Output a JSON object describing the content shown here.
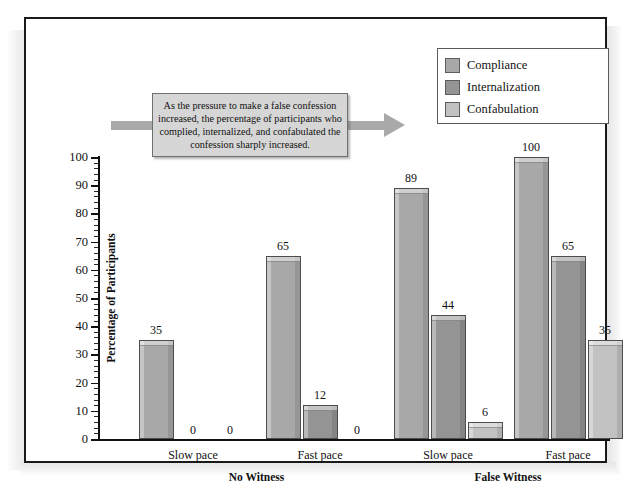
{
  "figure": {
    "frame_color": "#1a1a1a",
    "background": "#ffffff"
  },
  "callout": {
    "text": "As the pressure to make a false confession increased, the percentage of participants who complied, internalized, and confabulated the confession sharply increased.",
    "box_color": "#d6d6d6",
    "arrow_color": "#a9a9a9"
  },
  "legend": {
    "items": [
      {
        "label": "Compliance",
        "color": "#a8a8a8"
      },
      {
        "label": "Internalization",
        "color": "#949494"
      },
      {
        "label": "Confabulation",
        "color": "#c2c2c2"
      }
    ]
  },
  "chart_data": {
    "type": "bar",
    "title": "",
    "xlabel": "",
    "ylabel": "Percentage of Participants",
    "ylim": [
      0,
      100
    ],
    "ytick_step": 10,
    "yticks": [
      0,
      10,
      20,
      30,
      40,
      50,
      60,
      70,
      80,
      90,
      100
    ],
    "ytick_labels": [
      "0",
      "10",
      "20",
      "30",
      "40",
      "50",
      "60",
      "70",
      "80",
      "90",
      "100"
    ],
    "grid": false,
    "legend_position": "top-right",
    "categories": [
      "Slow pace",
      "Fast pace",
      "Slow pace",
      "Fast pace"
    ],
    "group_labels": [
      "No Witness",
      "False Witness"
    ],
    "groups": [
      {
        "group": "No Witness",
        "pace": "Slow pace"
      },
      {
        "group": "No Witness",
        "pace": "Fast pace"
      },
      {
        "group": "False Witness",
        "pace": "Slow pace"
      },
      {
        "group": "False Witness",
        "pace": "Fast pace"
      }
    ],
    "series": [
      {
        "name": "Compliance",
        "color": "#a8a8a8",
        "values": [
          35,
          65,
          89,
          100
        ]
      },
      {
        "name": "Internalization",
        "color": "#949494",
        "values": [
          0,
          12,
          44,
          65
        ]
      },
      {
        "name": "Confabulation",
        "color": "#c2c2c2",
        "values": [
          0,
          0,
          6,
          35
        ]
      }
    ],
    "value_labels": [
      [
        "35",
        "0",
        "0"
      ],
      [
        "65",
        "12",
        "0"
      ],
      [
        "89",
        "44",
        "6"
      ],
      [
        "100",
        "65",
        "35"
      ]
    ]
  }
}
